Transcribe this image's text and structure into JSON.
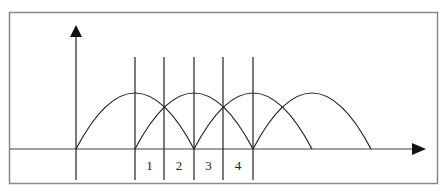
{
  "diagram": {
    "type": "overlapping-arches",
    "colors": {
      "line": "#222222",
      "border": "#888888",
      "background": "#ffffff"
    },
    "axes": {
      "x_arrow": true,
      "y_arrow": true
    },
    "arches": [
      {
        "start": 0,
        "end": 4
      },
      {
        "start": 2,
        "end": 6
      },
      {
        "start": 4,
        "end": 8
      },
      {
        "start": 6,
        "end": 10
      }
    ],
    "interval_labels": [
      "1",
      "2",
      "3",
      "4"
    ]
  }
}
